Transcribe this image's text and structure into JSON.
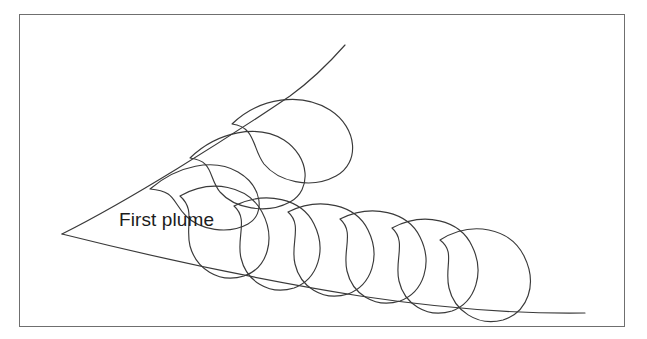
{
  "figure": {
    "kind": "line-diagram",
    "background_color": "#ffffff",
    "stroke_color": "#3a3a3a",
    "frame": {
      "border_color": "#6f6f6f",
      "x": 19,
      "y": 14,
      "width": 606,
      "height": 313
    },
    "annotations": [
      {
        "id": "first-plume",
        "text": "First plume",
        "x": 119,
        "y": 210,
        "font_size": 19,
        "color": "#1c1c1c"
      }
    ],
    "boundaries": [
      {
        "id": "upper-boundary",
        "description": "upper wedge boundary, concave-up curve from apex rising to the right",
        "path": "M62,234 C130,200 225,140 290,96 C312,80 330,62 345,45"
      },
      {
        "id": "lower-boundary",
        "description": "lower wedge boundary, gently curving down-right from apex",
        "path": "M62,234 C150,256 260,280 360,296 C440,308 520,314 585,313"
      }
    ],
    "lobes": [
      {
        "id": "upper-lobe-1",
        "row": "upper",
        "index": 1,
        "tail_x": 150,
        "tail_y": 189,
        "path": "M150,189 C178,165 214,158 238,172 C262,186 266,214 248,224 C228,235 200,230 186,216 C172,202 176,191 150,189 Z"
      },
      {
        "id": "upper-lobe-2",
        "row": "upper",
        "index": 2,
        "tail_x": 190,
        "tail_y": 158,
        "path": "M190,158 C218,131 258,124 284,140 C310,157 312,190 290,202 C266,215 234,208 220,192 C208,177 214,161 190,158 Z"
      },
      {
        "id": "upper-lobe-3",
        "row": "upper",
        "index": 3,
        "tail_x": 232,
        "tail_y": 124,
        "path": "M232,124 C260,97 302,92 330,110 C358,128 360,163 336,176 C310,190 278,181 264,164 C252,148 256,127 232,124 Z"
      },
      {
        "id": "lower-lobe-1",
        "row": "lower",
        "index": 1,
        "tail_x": 180,
        "tail_y": 196,
        "path": "M180,196 C212,178 248,186 262,212 C276,238 268,268 244,276 C218,284 196,268 190,246 C185,226 196,210 180,196 Z"
      },
      {
        "id": "lower-lobe-2",
        "row": "lower",
        "index": 2,
        "tail_x": 234,
        "tail_y": 206,
        "path": "M234,206 C266,190 302,199 314,224 C327,250 318,279 294,288 C268,296 246,280 241,258 C236,238 249,219 234,206 Z"
      },
      {
        "id": "lower-lobe-3",
        "row": "lower",
        "index": 3,
        "tail_x": 288,
        "tail_y": 212,
        "path": "M288,212 C320,196 356,205 368,230 C381,256 372,285 348,294 C322,302 300,286 295,264 C290,244 303,225 288,212 Z"
      },
      {
        "id": "lower-lobe-4",
        "row": "lower",
        "index": 4,
        "tail_x": 340,
        "tail_y": 219,
        "path": "M340,219 C372,203 408,212 420,237 C433,263 424,292 400,301 C374,309 352,293 347,271 C342,251 355,232 340,219 Z"
      },
      {
        "id": "lower-lobe-5",
        "row": "lower",
        "index": 5,
        "tail_x": 392,
        "tail_y": 228,
        "path": "M392,228 C424,211 460,220 472,246 C485,272 476,302 452,311 C426,319 404,303 399,281 C394,261 407,241 392,228 Z"
      },
      {
        "id": "lower-lobe-6",
        "row": "lower",
        "index": 6,
        "tail_x": 440,
        "tail_y": 240,
        "path": "M440,240 C472,220 510,228 524,256 C538,284 528,312 503,320 C477,327 454,310 449,288 C444,267 456,252 440,240 Z"
      }
    ]
  }
}
